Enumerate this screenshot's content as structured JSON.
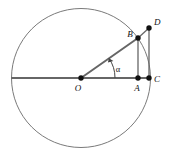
{
  "figure": {
    "background_color": "#ffffff",
    "stroke_color": "#555555",
    "circle_stroke_color": "#777777",
    "label_color": "#111111",
    "point_fill_color": "#111111",
    "width": 174,
    "height": 162
  },
  "circle": {
    "center_x": 81,
    "center_y": 78,
    "radius": 69.5,
    "stroke_width": 1
  },
  "points": [
    {
      "id": "O",
      "label": "O",
      "x": 81,
      "y": 78,
      "label_x": 78,
      "label_y": 90,
      "radius": 2.6
    },
    {
      "id": "B",
      "label": "B",
      "x": 138,
      "y": 38,
      "label_x": 128,
      "label_y": 37,
      "radius": 2.6
    },
    {
      "id": "A",
      "label": "A",
      "x": 138,
      "y": 78,
      "label_x": 135,
      "label_y": 90,
      "radius": 2.6
    },
    {
      "id": "C",
      "label": "C",
      "x": 149,
      "y": 78,
      "label_x": 153,
      "label_y": 81,
      "radius": 2.6
    },
    {
      "id": "D",
      "label": "D",
      "x": 149,
      "y": 28,
      "label_x": 153,
      "label_y": 24,
      "radius": 2.6
    }
  ],
  "segments": [
    {
      "id": "diameter",
      "name": "horizontal-diameter",
      "x1": 12,
      "y1": 78,
      "x2": 150,
      "y2": 78,
      "stroke_width": 2
    },
    {
      "id": "radius-OB",
      "name": "radius-o-to-b",
      "x1": 81,
      "y1": 78,
      "x2": 138,
      "y2": 38,
      "stroke_width": 2
    },
    {
      "id": "seg-BA",
      "name": "vertical-b-to-a",
      "x1": 138,
      "y1": 38,
      "x2": 138,
      "y2": 78,
      "stroke_width": 1.4
    },
    {
      "id": "seg-DC",
      "name": "vertical-d-to-c",
      "x1": 149,
      "y1": 28,
      "x2": 149,
      "y2": 78,
      "stroke_width": 1.4
    },
    {
      "id": "seg-BD",
      "name": "segment-b-to-d",
      "x1": 138,
      "y1": 38,
      "x2": 149,
      "y2": 28,
      "stroke_width": 1.4
    }
  ],
  "angle": {
    "symbol": "α",
    "label_x": 118,
    "label_y": 72,
    "vertex_x": 81,
    "vertex_y": 78,
    "arc_radius": 34,
    "arc_path": "M 115 78 A 34 34 0 0 0 108.9 58.3",
    "arrow_path": "M 108.9 58.3 L 112.6 60.6 L 107.6 62.3 Z"
  }
}
